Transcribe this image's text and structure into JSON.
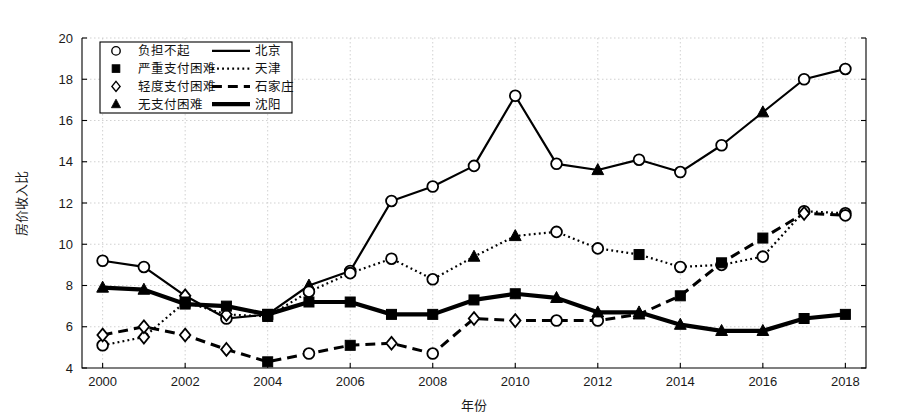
{
  "chart_data": {
    "type": "line",
    "title": "",
    "xlabel": "年份",
    "ylabel": "房价收入比",
    "xlim": [
      1999.5,
      2018.5
    ],
    "ylim": [
      4,
      20
    ],
    "grid": true,
    "x": [
      2000,
      2001,
      2002,
      2003,
      2004,
      2005,
      2006,
      2007,
      2008,
      2009,
      2010,
      2011,
      2012,
      2013,
      2014,
      2015,
      2016,
      2017,
      2018
    ],
    "xticks": [
      2000,
      2002,
      2004,
      2006,
      2008,
      2010,
      2012,
      2014,
      2016,
      2018
    ],
    "yticks": [
      4,
      6,
      8,
      10,
      12,
      14,
      16,
      18,
      20
    ],
    "legend_position": "upper-left",
    "series": [
      {
        "name": "北京",
        "line_style": "solid",
        "line_width": 2.2,
        "values": [
          9.2,
          8.9,
          7.5,
          6.4,
          6.6,
          8.0,
          8.7,
          12.1,
          12.8,
          13.8,
          17.2,
          13.9,
          13.6,
          14.1,
          13.5,
          14.8,
          16.4,
          18.0,
          18.5
        ]
      },
      {
        "name": "天津",
        "line_style": "dotted",
        "line_width": 2.2,
        "values": [
          5.1,
          5.5,
          7.2,
          6.6,
          6.5,
          7.7,
          8.6,
          9.3,
          8.3,
          9.4,
          10.4,
          10.6,
          9.8,
          9.5,
          8.9,
          9.0,
          9.4,
          11.6,
          11.5
        ]
      },
      {
        "name": "石家庄",
        "line_style": "dashed",
        "line_width": 3.0,
        "values": [
          5.6,
          6.0,
          5.6,
          4.9,
          4.3,
          4.7,
          5.1,
          5.2,
          4.7,
          6.4,
          6.3,
          6.3,
          6.3,
          6.6,
          7.5,
          9.1,
          10.3,
          11.5,
          11.4
        ]
      },
      {
        "name": "沈阳",
        "line_style": "solid-thick",
        "line_width": 4.2,
        "values": [
          7.9,
          7.8,
          7.1,
          7.0,
          6.6,
          7.2,
          7.2,
          6.6,
          6.6,
          7.3,
          7.6,
          7.4,
          6.7,
          6.7,
          6.1,
          5.8,
          5.8,
          6.4,
          6.6
        ]
      }
    ],
    "marker_legend": [
      {
        "marker": "circle-open",
        "label": "负担不起"
      },
      {
        "marker": "square-filled",
        "label": "严重支付困难"
      },
      {
        "marker": "diamond-open",
        "label": "轻度支付困难"
      },
      {
        "marker": "triangle-filled",
        "label": "无支付困难"
      }
    ],
    "markers_by_point": {
      "北京": [
        "circle-open",
        "circle-open",
        "diamond-open",
        "circle-open",
        "square-filled",
        "triangle-filled",
        "circle-open",
        "circle-open",
        "circle-open",
        "circle-open",
        "circle-open",
        "circle-open",
        "triangle-filled",
        "circle-open",
        "circle-open",
        "circle-open",
        "triangle-filled",
        "circle-open",
        "circle-open"
      ],
      "天津": [
        "circle-open",
        "diamond-open",
        "square-filled",
        "diamond-open",
        "square-filled",
        "circle-open",
        "circle-open",
        "circle-open",
        "circle-open",
        "triangle-filled",
        "triangle-filled",
        "circle-open",
        "circle-open",
        "square-filled",
        "circle-open",
        "circle-open",
        "circle-open",
        "circle-open",
        "circle-open"
      ],
      "石家庄": [
        "diamond-open",
        "diamond-open",
        "diamond-open",
        "diamond-open",
        "square-filled",
        "circle-open",
        "square-filled",
        "diamond-open",
        "circle-open",
        "diamond-open",
        "diamond-open",
        "circle-open",
        "circle-open",
        "triangle-filled",
        "square-filled",
        "square-filled",
        "square-filled",
        "diamond-open",
        "circle-open"
      ],
      "沈阳": [
        "triangle-filled",
        "triangle-filled",
        "square-filled",
        "square-filled",
        "square-filled",
        "square-filled",
        "square-filled",
        "square-filled",
        "square-filled",
        "square-filled",
        "square-filled",
        "triangle-filled",
        "triangle-filled",
        "triangle-filled",
        "triangle-filled",
        "triangle-filled",
        "triangle-filled",
        "square-filled",
        "square-filled"
      ]
    },
    "colors": {
      "line": "#000000",
      "grid": "#cccccc",
      "axis": "#000000",
      "background": "#ffffff"
    }
  }
}
